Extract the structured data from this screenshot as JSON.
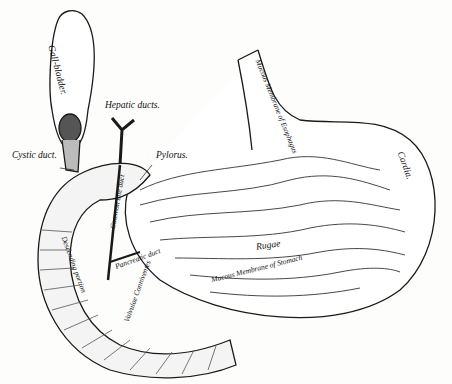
{
  "figure": {
    "labels": {
      "gall_bladder": "Gall-bladder.",
      "hepatic_ducts": "Hepatic ducts.",
      "cystic_duct": "Cystic duct.",
      "pylorus": "Pylorus.",
      "cardia": "Cardia.",
      "esophagus_mucosa": "Mucous Membrane of Esophagus",
      "rugae": "Rugae",
      "stomach_mucosa": "Mucous Membrane of Stomach",
      "descending_portion": "Descending portion",
      "pancreatic_duct": "Pancreatic duct",
      "common_bile_duct": "Common bile duct",
      "valvulae": "Valvulae Conniventes"
    },
    "colors": {
      "ink": "#1a1a1a",
      "paper": "#fdfdfc",
      "shade": "#8a8a8a"
    }
  }
}
